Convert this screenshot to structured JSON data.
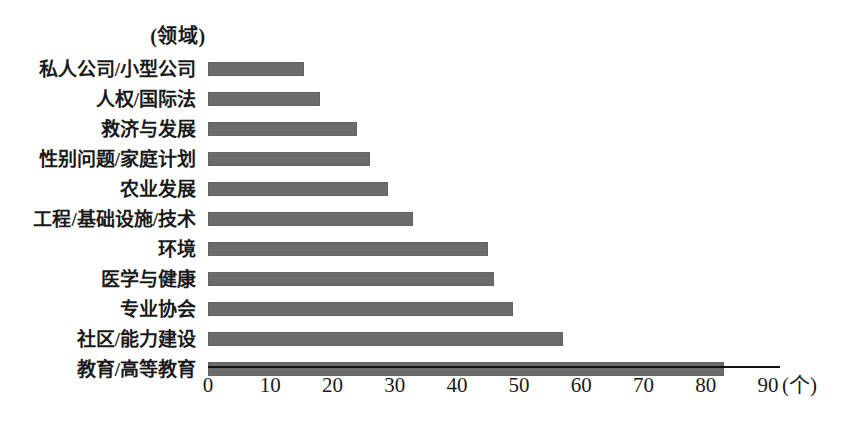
{
  "chart_data": {
    "type": "bar",
    "orientation": "horizontal",
    "title": "(领域)",
    "xlabel": "(个)",
    "ylabel": "",
    "xlim": [
      0,
      90
    ],
    "grid": false,
    "legend": null,
    "bar_color": "#6b6b6b",
    "axis_color": "#111111",
    "background": "#ffffff",
    "xticks": [
      0,
      10,
      20,
      30,
      40,
      50,
      60,
      70,
      80,
      90
    ],
    "xtick_labels": [
      "0",
      "10",
      "20",
      "30",
      "40",
      "50",
      "60",
      "70",
      "80",
      "90"
    ],
    "unit_label": "(个)",
    "categories": [
      "私人公司/小型公司",
      "人权/国际法",
      "救济与发展",
      "性别问题/家庭计划",
      "农业发展",
      "工程/基础设施/技术",
      "环境",
      "医学与健康",
      "专业协会",
      "社区/能力建设",
      "教育/高等教育"
    ],
    "values": [
      15.5,
      18,
      24,
      26,
      29,
      33,
      45,
      46,
      49,
      57,
      83
    ]
  }
}
